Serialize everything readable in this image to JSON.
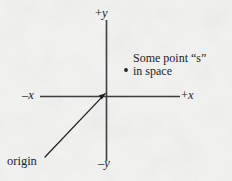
{
  "figure": {
    "type": "cartesian-coordinate-diagram",
    "width": 232,
    "height": 181,
    "background_color": "#f4f4f3",
    "ink_color": "#1c1c1c"
  },
  "axes": {
    "origin": {
      "x": 106,
      "y": 96
    },
    "x_axis": {
      "start_x": 40,
      "end_x": 180,
      "y": 96
    },
    "y_axis": {
      "x": 106,
      "start_y": 20,
      "end_y": 161
    },
    "labels": {
      "positive_y": {
        "sign": "+",
        "variable": "y",
        "text": "+y"
      },
      "negative_y": {
        "sign": "–",
        "variable": "y",
        "text": "–y"
      },
      "negative_x": {
        "sign": "–",
        "variable": "x",
        "text": "–x"
      },
      "positive_x": {
        "sign": "+",
        "variable": "x",
        "text": "+x"
      }
    }
  },
  "point": {
    "marker": {
      "x": 126,
      "y": 70,
      "radius": 2
    },
    "annotation_line_1": "Some  point “s”",
    "annotation_line_2": "in space"
  },
  "origin_callout": {
    "label": "origin",
    "leader_line": {
      "from_x": 45,
      "from_y": 157,
      "to_x": 104,
      "to_y": 94
    },
    "arrowhead_at": "origin"
  }
}
